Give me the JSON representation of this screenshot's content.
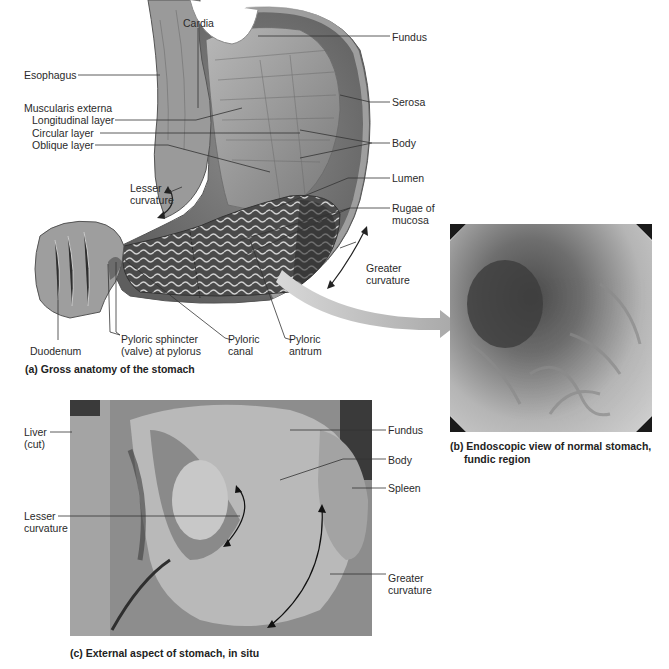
{
  "panel_a": {
    "caption": "(a) Gross anatomy of the stomach",
    "labels": {
      "cardia": "Cardia",
      "fundus": "Fundus",
      "esophagus": "Esophagus",
      "serosa": "Serosa",
      "muscularis": "Muscularis externa",
      "longitudinal": "Longitudinal layer",
      "circular": "Circular layer",
      "oblique": "Oblique layer",
      "body": "Body",
      "lumen": "Lumen",
      "lesser_1": "Lesser",
      "lesser_2": "curvature",
      "rugae_1": "Rugae of",
      "rugae_2": "mucosa",
      "greater_1": "Greater",
      "greater_2": "curvature",
      "duodenum": "Duodenum",
      "pyloric_sphincter_1": "Pyloric sphincter",
      "pyloric_sphincter_2": "(valve) at pylorus",
      "pyloric_canal_1": "Pyloric",
      "pyloric_canal_2": "canal",
      "pyloric_antrum_1": "Pyloric",
      "pyloric_antrum_2": "antrum"
    }
  },
  "panel_b": {
    "caption_1": "(b) Endoscopic view of normal stomach,",
    "caption_2": "fundic region"
  },
  "panel_c": {
    "caption": "(c) External aspect of stomach, in situ",
    "labels": {
      "liver_1": "Liver",
      "liver_2": "(cut)",
      "fundus": "Fundus",
      "body": "Body",
      "spleen": "Spleen",
      "lesser_1": "Lesser",
      "lesser_2": "curvature",
      "greater_1": "Greater",
      "greater_2": "curvature"
    }
  }
}
